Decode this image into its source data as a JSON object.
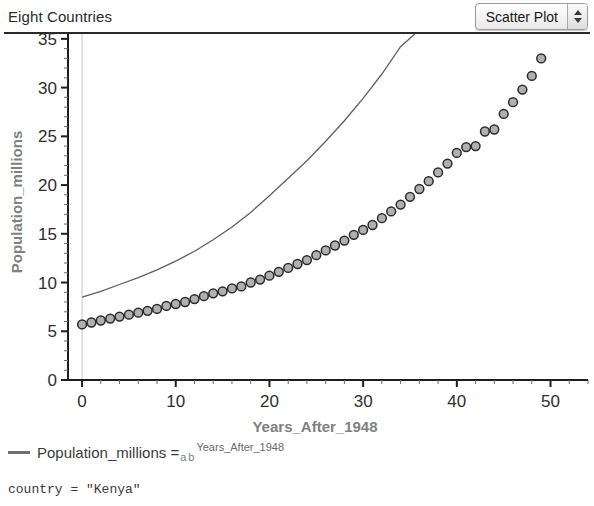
{
  "window": {
    "title": "Eight Countries"
  },
  "plot_type_control": {
    "value": "Scatter Plot",
    "stepper_up": "increment-arrow",
    "stepper_down": "decrement-arrow"
  },
  "legend": {
    "marker": "line-marker",
    "lhs": "Population_millions =",
    "coef_a": "a",
    "coef_b": "b",
    "exponent": "Years_After_1948"
  },
  "status": {
    "text": "country = \"Kenya\""
  },
  "colors": {
    "marker_fill": "#b0b0b0",
    "marker_stroke": "#2b2b2b",
    "fit_line": "#5f5f5f",
    "axis": "#1e1e1e",
    "axis_title": "#808080",
    "gridline": "#c8c8c8"
  },
  "chart_data": {
    "type": "scatter",
    "title": "Eight Countries",
    "xlabel": "Years_After_1948",
    "ylabel": "Population_millions",
    "xlim": [
      -1.5,
      54
    ],
    "ylim": [
      0,
      35.5
    ],
    "xticks": [
      0,
      10,
      20,
      30,
      40,
      50
    ],
    "yticks": [
      0,
      5,
      10,
      15,
      20,
      25,
      30,
      35
    ],
    "xtick_labels": [
      "0",
      "10",
      "20",
      "30",
      "40",
      "50"
    ],
    "ytick_labels": [
      "0",
      "5",
      "10",
      "15",
      "20",
      "25",
      "30",
      "35"
    ],
    "minor_xtick_step": 2,
    "minor_ytick_step": 1,
    "grid": false,
    "gridline_x": 0,
    "legend_position": "below-axes",
    "series": [
      {
        "name": "Population_millions",
        "type": "scatter",
        "marker": "circle",
        "x": [
          0,
          1,
          2,
          3,
          4,
          5,
          6,
          7,
          8,
          9,
          10,
          11,
          12,
          13,
          14,
          15,
          16,
          17,
          18,
          19,
          20,
          21,
          22,
          23,
          24,
          25,
          26,
          27,
          28,
          29,
          30,
          31,
          32,
          33,
          34,
          35,
          36,
          37,
          38,
          39,
          40,
          41,
          42,
          43,
          44,
          45,
          46,
          47,
          48,
          49
        ],
        "y": [
          5.7,
          5.9,
          6.1,
          6.3,
          6.5,
          6.7,
          6.9,
          7.1,
          7.3,
          7.6,
          7.8,
          8.0,
          8.3,
          8.6,
          8.9,
          9.1,
          9.4,
          9.6,
          10.0,
          10.3,
          10.7,
          11.1,
          11.5,
          11.9,
          12.3,
          12.8,
          13.3,
          13.8,
          14.3,
          14.9,
          15.4,
          15.9,
          16.6,
          17.3,
          18.0,
          18.8,
          19.6,
          20.4,
          21.3,
          22.2,
          23.3,
          23.9,
          24.0,
          25.5,
          25.7,
          27.3,
          28.5,
          29.8,
          31.2,
          33.0
        ]
      },
      {
        "name": "fit_curve",
        "type": "line",
        "equation": "Population_millions = a b^Years_After_1948",
        "x": [
          0,
          2,
          4,
          6,
          8,
          10,
          12,
          14,
          16,
          18,
          20,
          22,
          24,
          26,
          28,
          30,
          32,
          34,
          35.5
        ],
        "y": [
          8.5,
          9.1,
          9.8,
          10.5,
          11.3,
          12.2,
          13.2,
          14.4,
          15.7,
          17.2,
          18.9,
          20.7,
          22.5,
          24.5,
          26.6,
          28.9,
          31.4,
          34.2,
          35.5
        ]
      }
    ]
  }
}
